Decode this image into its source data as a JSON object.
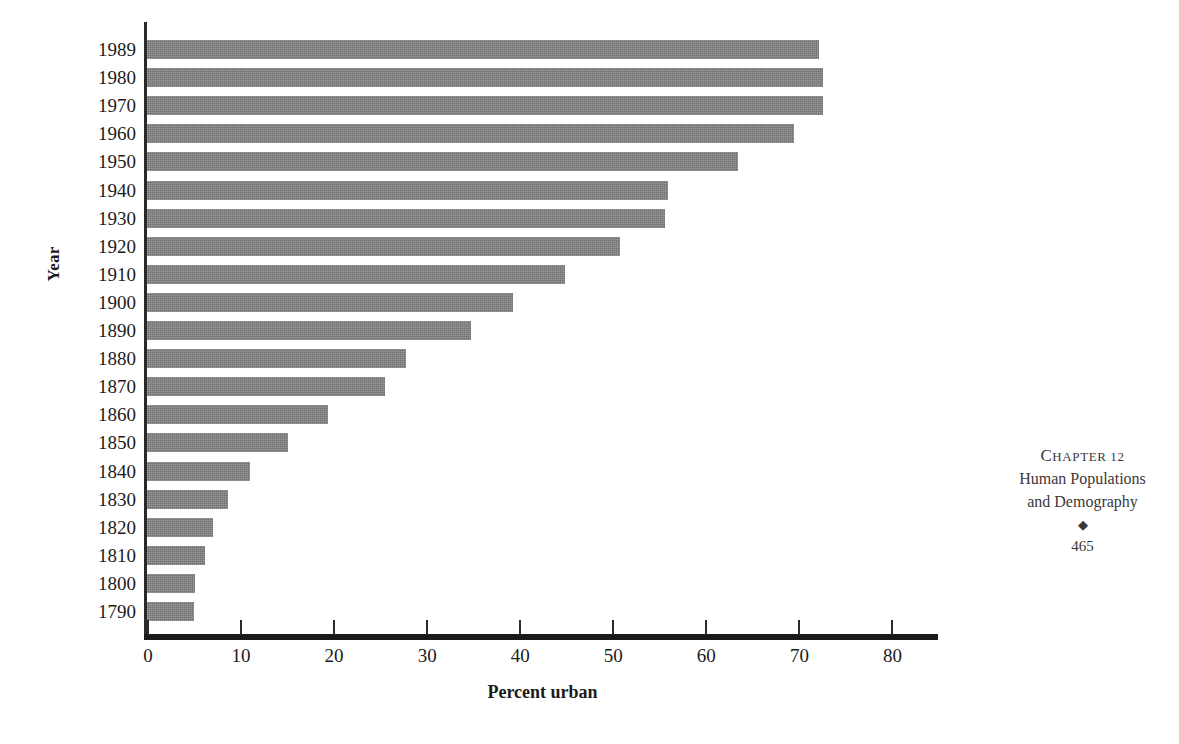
{
  "chart_data": {
    "type": "bar",
    "orientation": "horizontal",
    "title": "",
    "xlabel": "Percent urban",
    "ylabel": "Year",
    "xlim": [
      0,
      85
    ],
    "xticks": [
      0,
      10,
      20,
      30,
      40,
      50,
      60,
      70,
      80
    ],
    "grid": false,
    "legend": null,
    "bar_color": "#7f7f7f",
    "categories": [
      "1989",
      "1980",
      "1970",
      "1960",
      "1950",
      "1940",
      "1930",
      "1920",
      "1910",
      "1900",
      "1890",
      "1880",
      "1870",
      "1860",
      "1850",
      "1840",
      "1830",
      "1820",
      "1810",
      "1800",
      "1790"
    ],
    "values": [
      72.2,
      72.6,
      72.6,
      69.5,
      63.5,
      56.0,
      55.7,
      50.8,
      44.9,
      39.3,
      34.8,
      27.8,
      25.6,
      19.4,
      15.2,
      11.1,
      8.7,
      7.1,
      6.2,
      5.2,
      5.1
    ],
    "series": [
      {
        "name": "Percent urban",
        "values": [
          72.2,
          72.6,
          72.6,
          69.5,
          63.5,
          56.0,
          55.7,
          50.8,
          44.9,
          39.3,
          34.8,
          27.8,
          25.6,
          19.4,
          15.2,
          11.1,
          8.7,
          7.1,
          6.2,
          5.2,
          5.1
        ]
      }
    ]
  },
  "running_head": {
    "chapter": "CHAPTER 12",
    "title_line_1": "Human Populations",
    "title_line_2": "and Demography",
    "ornament": "◆",
    "page_number": "465"
  }
}
